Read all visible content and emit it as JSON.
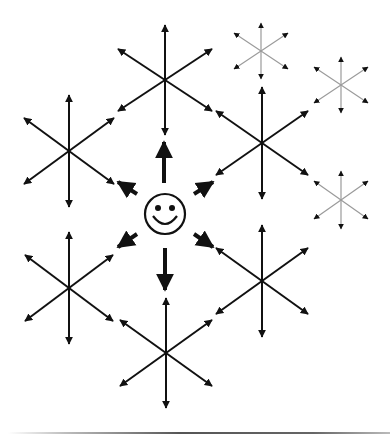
{
  "diagram": {
    "title": "",
    "colors": {
      "background": "#ffffff",
      "primary_stroke": "#111111",
      "faded_stroke": "#9a9a9a",
      "faded_head": "#111111"
    },
    "center_agent": {
      "icon": "smiley-face-icon",
      "cx": 165,
      "cy": 214,
      "r": 20
    },
    "agent_arrows": [
      {
        "direction": "up",
        "from": [
          164,
          183
        ],
        "to": [
          164,
          142
        ]
      },
      {
        "direction": "down",
        "from": [
          165,
          248
        ],
        "to": [
          165,
          290
        ]
      },
      {
        "direction": "up-left",
        "from": [
          137,
          194
        ],
        "to": [
          118,
          182
        ]
      },
      {
        "direction": "up-right",
        "from": [
          194,
          194
        ],
        "to": [
          213,
          182
        ]
      },
      {
        "direction": "down-left",
        "from": [
          137,
          234
        ],
        "to": [
          118,
          247
        ]
      },
      {
        "direction": "down-right",
        "from": [
          194,
          234
        ],
        "to": [
          213,
          247
        ]
      }
    ],
    "stars": [
      {
        "name": "star-top",
        "cx": 165,
        "cy": 80,
        "vr": 55,
        "dx": 47,
        "dy": 31,
        "style": "bold"
      },
      {
        "name": "star-left-upper",
        "cx": 69,
        "cy": 151,
        "vr": 56,
        "dx": 45,
        "dy": 33,
        "style": "bold"
      },
      {
        "name": "star-right-upper",
        "cx": 262,
        "cy": 143,
        "vr": 56,
        "dx": 46,
        "dy": 32,
        "style": "bold"
      },
      {
        "name": "star-left-lower",
        "cx": 69,
        "cy": 288,
        "vr": 56,
        "dx": 44,
        "dy": 33,
        "style": "bold"
      },
      {
        "name": "star-right-lower",
        "cx": 262,
        "cy": 281,
        "vr": 56,
        "dx": 46,
        "dy": 33,
        "style": "bold"
      },
      {
        "name": "star-bottom",
        "cx": 166,
        "cy": 353,
        "vr": 55,
        "dx": 46,
        "dy": 33,
        "style": "bold"
      },
      {
        "name": "star-faded-1",
        "cx": 261,
        "cy": 51,
        "vr": 28,
        "dx": 27,
        "dy": 18,
        "style": "faded"
      },
      {
        "name": "star-faded-2",
        "cx": 341,
        "cy": 85,
        "vr": 28,
        "dx": 27,
        "dy": 18,
        "style": "faded"
      },
      {
        "name": "star-faded-3",
        "cx": 341,
        "cy": 200,
        "vr": 29,
        "dx": 27,
        "dy": 19,
        "style": "faded"
      }
    ]
  }
}
